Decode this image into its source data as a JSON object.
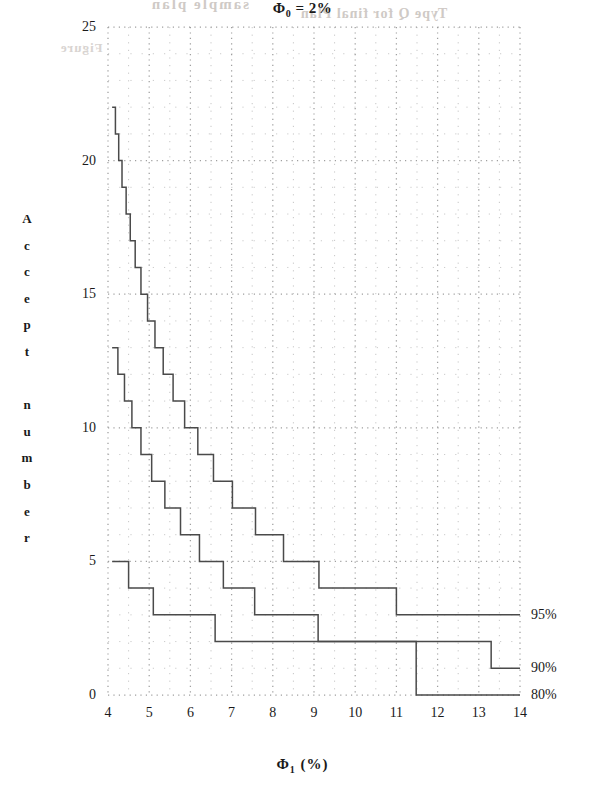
{
  "title_parts": {
    "symbol": "Φ",
    "sub": "0",
    "rest": " = 2%"
  },
  "bleed_text": {
    "line_a": "sample plan",
    "line_b": "Type Q for final Plan",
    "line_c": "Figure"
  },
  "axes": {
    "y_title_chars": [
      "A",
      "c",
      "c",
      "e",
      "p",
      "t",
      "",
      "n",
      "u",
      "m",
      "b",
      "e",
      "r"
    ],
    "y_title_text": "Accept number",
    "x_title_symbol": "Φ",
    "x_title_sub": "1",
    "x_title_rest": " (%)",
    "x_title_text": "Φ₁ (%)",
    "y_ticks": [
      "0",
      "5",
      "10",
      "15",
      "20",
      "25"
    ],
    "x_ticks": [
      "4",
      "5",
      "6",
      "7",
      "8",
      "9",
      "10",
      "11",
      "12",
      "13",
      "14"
    ]
  },
  "series_labels": [
    "95%",
    "90%",
    "80%"
  ],
  "colors": {
    "line": "#4a4a4a",
    "grid": "#9a9a9a",
    "text": "#1a1a1a",
    "background": "#ffffff"
  },
  "chart_data": {
    "type": "line",
    "subtitle": "",
    "xlabel": "Φ₁ (%)",
    "ylabel": "Accept number",
    "xlim": [
      4,
      14
    ],
    "ylim": [
      0,
      25
    ],
    "grid": true,
    "grid_major_x": 1,
    "grid_minor_x": 0.5,
    "grid_major_y": 5,
    "grid_minor_y": 1,
    "legend_position": "right-end-of-line",
    "note": "Step (staircase) curves; each series is the accept number as a function of Φ₁ for a given confidence level.",
    "series": [
      {
        "name": "95%",
        "label": "95%",
        "step": "post",
        "points": [
          [
            4.1,
            22
          ],
          [
            4.18,
            21
          ],
          [
            4.26,
            20
          ],
          [
            4.34,
            19
          ],
          [
            4.44,
            18
          ],
          [
            4.54,
            17
          ],
          [
            4.66,
            16
          ],
          [
            4.8,
            15
          ],
          [
            4.96,
            14
          ],
          [
            5.14,
            13
          ],
          [
            5.34,
            12
          ],
          [
            5.58,
            11
          ],
          [
            5.86,
            10
          ],
          [
            6.18,
            9
          ],
          [
            6.56,
            8
          ],
          [
            7.02,
            7
          ],
          [
            7.58,
            6
          ],
          [
            8.26,
            5
          ],
          [
            9.12,
            4
          ],
          [
            11.0,
            3
          ],
          [
            14.0,
            3
          ]
        ]
      },
      {
        "name": "90%",
        "label": "90%",
        "step": "post",
        "points": [
          [
            4.1,
            13
          ],
          [
            4.24,
            12
          ],
          [
            4.4,
            11
          ],
          [
            4.58,
            10
          ],
          [
            4.8,
            9
          ],
          [
            5.06,
            8
          ],
          [
            5.38,
            7
          ],
          [
            5.76,
            6
          ],
          [
            6.22,
            5
          ],
          [
            6.8,
            4
          ],
          [
            7.56,
            3
          ],
          [
            9.1,
            2
          ],
          [
            13.3,
            1
          ],
          [
            14.0,
            1
          ]
        ]
      },
      {
        "name": "80%",
        "label": "80%",
        "step": "post",
        "points": [
          [
            4.1,
            5
          ],
          [
            4.5,
            4
          ],
          [
            5.1,
            3
          ],
          [
            6.6,
            2
          ],
          [
            11.48,
            1
          ],
          [
            11.48,
            0
          ],
          [
            14.0,
            0
          ]
        ]
      }
    ]
  }
}
